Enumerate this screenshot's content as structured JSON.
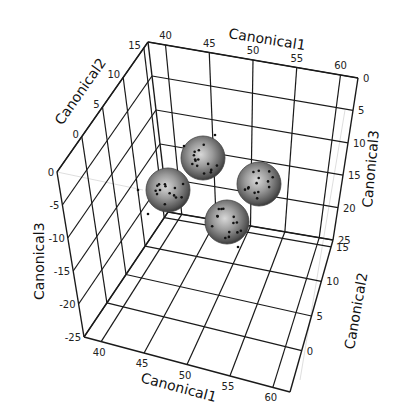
{
  "chart_data": {
    "type": "scatter3d",
    "title": "",
    "axes": {
      "x": {
        "label": "Canonical1",
        "ticks": [
          40,
          45,
          50,
          55,
          60
        ],
        "range": [
          38,
          62
        ]
      },
      "y": {
        "label": "Canonical2",
        "ticks": [
          0,
          5,
          10,
          15
        ],
        "range": [
          -6,
          16
        ]
      },
      "z": {
        "label": "Canonical3",
        "ticks": [
          0,
          -5,
          -10,
          -15,
          -20,
          -25
        ],
        "range": [
          -25,
          0
        ]
      }
    },
    "grid": true,
    "legend": null,
    "groups": [
      {
        "name": "cluster-1",
        "center_screen": [
          168,
          190
        ],
        "radius": 22
      },
      {
        "name": "cluster-2",
        "center_screen": [
          203,
          158
        ],
        "radius": 22
      },
      {
        "name": "cluster-3",
        "center_screen": [
          259,
          184
        ],
        "radius": 22
      },
      {
        "name": "cluster-4",
        "center_screen": [
          227,
          222
        ],
        "radius": 22
      }
    ],
    "outlier_points_screen": [
      [
        184,
        146
      ],
      [
        215,
        135
      ],
      [
        138,
        190
      ],
      [
        238,
        247
      ],
      [
        148,
        214
      ]
    ]
  },
  "labels": {
    "c1_top": "Canonical1",
    "c1_bottom": "Canonical1",
    "c2_left": "Canonical2",
    "c2_right": "Canonical2",
    "c3_left": "Canonical3",
    "c3_right": "Canonical3"
  }
}
